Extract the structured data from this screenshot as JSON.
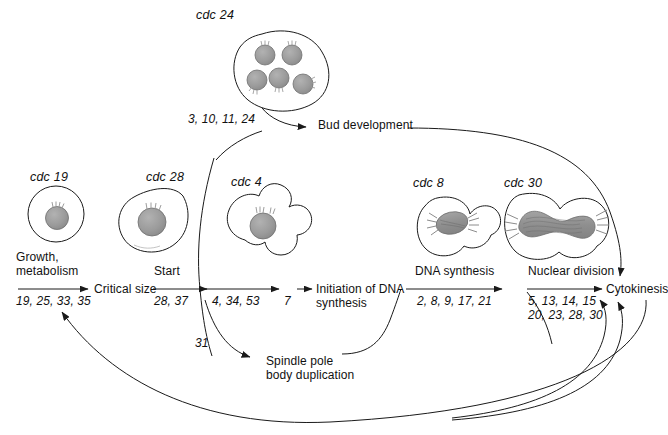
{
  "diagram": {
    "ink_color": "#1a1a1a",
    "nucleus_fill": "#9a9a9a",
    "spindle_fill": "#8f8f8f"
  },
  "cells": [
    {
      "key": "cdc19",
      "label": "cdc 19",
      "shape": "round-unbudded"
    },
    {
      "key": "cdc28",
      "label": "cdc 28",
      "shape": "pear-unbudded"
    },
    {
      "key": "cdc4",
      "label": "cdc 4",
      "shape": "multi-budded"
    },
    {
      "key": "cdc24",
      "label": "cdc 24",
      "shape": "large-multinucleate"
    },
    {
      "key": "cdc8",
      "label": "cdc 8",
      "shape": "budded-small-spindle"
    },
    {
      "key": "cdc30",
      "label": "cdc 30",
      "shape": "budded-elongated-spindle"
    }
  ],
  "stages": [
    {
      "key": "growth",
      "text_line1": "Growth,",
      "text_line2": "metabolism",
      "genes": "19, 25, 33, 35"
    },
    {
      "key": "criticalsize",
      "text_line1": "Critical size",
      "text_line2": "",
      "genes": ""
    },
    {
      "key": "start",
      "text_line1": "Start",
      "text_line2": "",
      "genes": "28, 37"
    },
    {
      "key": "budemerge",
      "text_line1": "",
      "text_line2": "",
      "genes": "4, 34, 53"
    },
    {
      "key": "preinit",
      "text_line1": "",
      "text_line2": "",
      "genes": "7"
    },
    {
      "key": "initdna",
      "text_line1": "Initiation of DNA",
      "text_line2": "synthesis",
      "genes": ""
    },
    {
      "key": "dnasynth",
      "text_line1": "DNA synthesis",
      "text_line2": "",
      "genes": "2, 8, 9, 17, 21"
    },
    {
      "key": "nucdiv",
      "text_line1": "Nuclear division",
      "text_line2": "",
      "genes_line1": "5, 13, 14, 15",
      "genes_line2": "20, 23, 28, 30"
    },
    {
      "key": "cytokinesis",
      "text_line1": "Cytokinesis",
      "text_line2": "",
      "genes": ""
    },
    {
      "key": "buddev",
      "text_line1": "Bud development",
      "text_line2": "",
      "genes": "3, 10, 11, 24"
    },
    {
      "key": "spindlepole",
      "text_line1": "Spindle pole",
      "text_line2": "body duplication",
      "genes": "31"
    }
  ],
  "labels": {
    "cdc24_genes": "3, 10, 11, 24",
    "bud_development": "Bud development",
    "spindle_pole_1": "Spindle pole",
    "spindle_pole_2": "body duplication",
    "spindle_genes": "31",
    "cytokinesis": "Cytokinesis",
    "nuclear_division": "Nuclear division",
    "nuclear_genes_1": "5, 13, 14, 15",
    "nuclear_genes_2": "20, 23, 28, 30",
    "dna_synthesis": "DNA synthesis",
    "dna_genes": "2, 8, 9, 17, 21",
    "init_dna_1": "Initiation of DNA",
    "init_dna_2": "synthesis",
    "seven": "7",
    "bud_genes": "4, 34, 53",
    "start": "Start",
    "start_genes": "28, 37",
    "critical_size": "Critical size",
    "growth_1": "Growth,",
    "growth_2": "metabolism",
    "growth_genes": "19, 25, 33, 35",
    "cdc19": "cdc 19",
    "cdc28": "cdc 28",
    "cdc4": "cdc 4",
    "cdc24": "cdc 24",
    "cdc8": "cdc 8",
    "cdc30": "cdc 30"
  }
}
